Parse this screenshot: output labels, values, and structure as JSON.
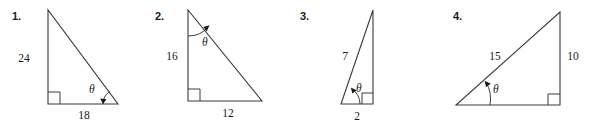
{
  "page": {
    "background_color": "#ffffff",
    "line_color": "#3a3a3a",
    "text_color": "#1a1a1a",
    "figure_count": 4
  },
  "figures": [
    {
      "number": "1.",
      "angle_symbol": "θ",
      "angle_vertex": "bottom-right",
      "right_angle_vertex": "bottom-left",
      "labels": {
        "vertical": "24",
        "horizontal": "18"
      },
      "sides": [
        {
          "name": "opposite-vertical-leg",
          "value": "24",
          "position": "left"
        },
        {
          "name": "adjacent-horizontal-leg",
          "value": "18",
          "position": "bottom"
        }
      ]
    },
    {
      "number": "2.",
      "angle_symbol": "θ",
      "angle_vertex": "top",
      "right_angle_vertex": "bottom-left",
      "labels": {
        "vertical": "16",
        "horizontal": "12"
      },
      "sides": [
        {
          "name": "adjacent-vertical-leg",
          "value": "16",
          "position": "left"
        },
        {
          "name": "opposite-horizontal-leg",
          "value": "12",
          "position": "bottom"
        }
      ]
    },
    {
      "number": "3.",
      "angle_symbol": "θ",
      "angle_vertex": "bottom-left",
      "right_angle_vertex": "bottom-right",
      "labels": {
        "hypotenuse": "7",
        "horizontal": "2"
      },
      "sides": [
        {
          "name": "hypotenuse",
          "value": "7",
          "position": "upper-left"
        },
        {
          "name": "adjacent-horizontal-leg",
          "value": "2",
          "position": "bottom"
        }
      ]
    },
    {
      "number": "4.",
      "angle_symbol": "θ",
      "angle_vertex": "bottom-left",
      "right_angle_vertex": "bottom-right",
      "labels": {
        "hypotenuse": "15",
        "vertical": "10"
      },
      "sides": [
        {
          "name": "hypotenuse",
          "value": "15",
          "position": "upper-left"
        },
        {
          "name": "opposite-vertical-leg",
          "value": "10",
          "position": "right"
        }
      ]
    }
  ]
}
